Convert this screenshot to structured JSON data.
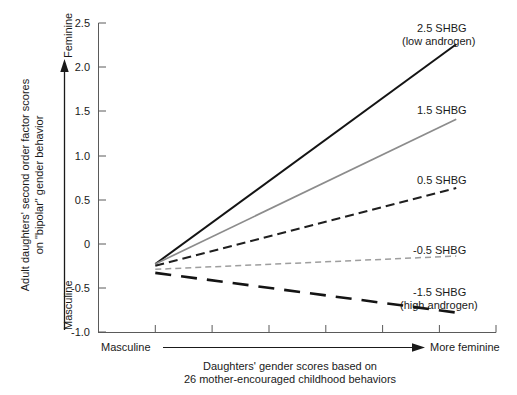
{
  "chart_data": {
    "type": "line",
    "title": "",
    "xlabel": "Daughters' gender scores based on 26 mother-encouraged childhood behaviors",
    "ylabel": "Adult daughters' second order factor scores on \"bipolar\" gender behavior",
    "xlim": [
      0,
      7
    ],
    "ylim": [
      -1.0,
      2.5
    ],
    "grid": false,
    "legend_position": "right-inline",
    "yticks": [
      "2.5",
      "2.0",
      "1.5",
      "1.0",
      "0.5",
      "0",
      "-0.5",
      "-1.0"
    ],
    "ytick_values": [
      2.5,
      2.0,
      1.5,
      1.0,
      0.5,
      0,
      -0.5,
      -1.0
    ],
    "xtick_count": 8,
    "x_axis_direction_left": "Masculine",
    "x_axis_direction_right": "More feminine",
    "y_axis_direction_top": "Feminine",
    "y_axis_direction_bottom": "Masculine",
    "x": [
      1.0,
      6.3
    ],
    "series": [
      {
        "name": "2.5 SHBG",
        "sublabel": "(low androgen)",
        "values": [
          -0.23,
          2.26
        ],
        "color": "#141414",
        "style": "solid",
        "width": 2.0
      },
      {
        "name": "1.5 SHBG",
        "sublabel": "",
        "values": [
          -0.23,
          1.41
        ],
        "color": "#8c8c8c",
        "style": "solid",
        "width": 1.7
      },
      {
        "name": "0.5 SHBG",
        "sublabel": "",
        "values": [
          -0.25,
          0.63
        ],
        "color": "#1f1f1f",
        "style": "dashed",
        "width": 2.0
      },
      {
        "name": "-0.5 SHBG",
        "sublabel": "",
        "values": [
          -0.29,
          -0.14
        ],
        "color": "#9e9e9e",
        "style": "dashed-fine",
        "width": 1.5
      },
      {
        "name": "-1.5 SHBG",
        "sublabel": "(high androgen)",
        "values": [
          -0.33,
          -0.78
        ],
        "color": "#141414",
        "style": "long-dash",
        "width": 2.6
      }
    ]
  },
  "axes": {
    "y_ticks": [
      {
        "label": "2.5"
      },
      {
        "label": "2.0"
      },
      {
        "label": "1.5"
      },
      {
        "label": "1.0"
      },
      {
        "label": "0.5"
      },
      {
        "label": "0"
      },
      {
        "label": "-0.5"
      },
      {
        "label": "-1.0"
      }
    ],
    "y_axis_title_line1": "Adult daughters' second order factor scores",
    "y_axis_title_line2": "on \"bipolar\" gender behavior",
    "y_direction_top": "Feminine",
    "y_direction_bottom": "Masculine",
    "x_direction_left": "Masculine",
    "x_direction_right": "More feminine",
    "x_caption_line1": "Daughters' gender scores based on",
    "x_caption_line2": "26 mother-encouraged childhood behaviors"
  },
  "labels": {
    "s1_line1": "2.5 SHBG",
    "s1_line2": "(low androgen)",
    "s2_line1": "1.5 SHBG",
    "s3_line1": "0.5 SHBG",
    "s4_line1": "-0.5 SHBG",
    "s5_line1": "-1.5 SHBG",
    "s5_line2": "(high androgen)"
  },
  "colors": {
    "axis": "#3d3d3d",
    "text": "#1a1a1a",
    "dark_series": "#141414",
    "gray_series": "#8c8c8c",
    "light_gray_series": "#9e9e9e",
    "background": "#ffffff"
  }
}
